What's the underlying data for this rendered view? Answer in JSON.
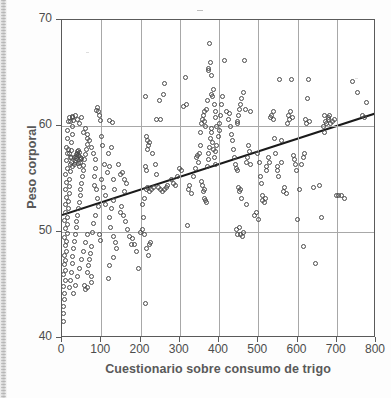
{
  "figure": {
    "kind": "scatter-plot",
    "background_color": "#ffffff",
    "frame_color": "#5a5a5a",
    "grid_color": "#a8a8a8",
    "marker_color": "#4a4a4a",
    "trendline_color": "#1a1a1a",
    "label_color": "#595959"
  },
  "axis": {
    "x_label": "Cuestionario sobre consumo de trigo",
    "y_label": "Peso corporal",
    "x_ticklabels": [
      "0",
      "100",
      "200",
      "300",
      "400",
      "500",
      "600",
      "700",
      "800"
    ],
    "y_ticklabels": [
      "40",
      "50",
      "60",
      "70"
    ]
  },
  "chart_data": {
    "type": "scatter",
    "title": "",
    "xlabel": "Cuestionario sobre consumo de trigo",
    "ylabel": "Peso corporal",
    "xlim": [
      0,
      800
    ],
    "ylim": [
      40,
      70
    ],
    "xticks": [
      0,
      100,
      200,
      300,
      400,
      500,
      600,
      700,
      800
    ],
    "yticks": [
      40,
      50,
      60,
      70
    ],
    "grid": true,
    "legend": null,
    "marker": "open-circle",
    "trendline": {
      "type": "linear-fit",
      "x_start": 0,
      "y_start": 51.6,
      "x_end": 800,
      "y_end": 61.2,
      "slope": 0.012,
      "intercept": 51.6
    },
    "points": [
      [
        3,
        41.6
      ],
      [
        4,
        42.3
      ],
      [
        5,
        43.0
      ],
      [
        6,
        43.6
      ],
      [
        7,
        44.2
      ],
      [
        4,
        44.9
      ],
      [
        8,
        45.4
      ],
      [
        5,
        46.0
      ],
      [
        9,
        46.4
      ],
      [
        6,
        46.9
      ],
      [
        10,
        47.3
      ],
      [
        7,
        47.8
      ],
      [
        11,
        48.2
      ],
      [
        8,
        48.7
      ],
      [
        12,
        49.1
      ],
      [
        6,
        49.5
      ],
      [
        13,
        49.9
      ],
      [
        9,
        50.3
      ],
      [
        14,
        50.7
      ],
      [
        7,
        51.1
      ],
      [
        15,
        51.4
      ],
      [
        10,
        51.8
      ],
      [
        16,
        52.2
      ],
      [
        8,
        52.6
      ],
      [
        17,
        52.9
      ],
      [
        11,
        53.3
      ],
      [
        18,
        53.6
      ],
      [
        9,
        54.0
      ],
      [
        19,
        54.3
      ],
      [
        12,
        54.7
      ],
      [
        20,
        55.0
      ],
      [
        10,
        55.4
      ],
      [
        21,
        55.7
      ],
      [
        13,
        56.0
      ],
      [
        22,
        56.4
      ],
      [
        11,
        56.7
      ],
      [
        23,
        57.0
      ],
      [
        14,
        57.4
      ],
      [
        24,
        57.7
      ],
      [
        12,
        58.0
      ],
      [
        25,
        58.4
      ],
      [
        15,
        58.8
      ],
      [
        26,
        59.2
      ],
      [
        13,
        59.6
      ],
      [
        27,
        60.0
      ],
      [
        17,
        60.4
      ],
      [
        28,
        60.8
      ],
      [
        20,
        44.8
      ],
      [
        22,
        45.4
      ],
      [
        24,
        46.2
      ],
      [
        26,
        47.0
      ],
      [
        28,
        47.7
      ],
      [
        30,
        48.4
      ],
      [
        32,
        49.1
      ],
      [
        34,
        49.8
      ],
      [
        36,
        50.4
      ],
      [
        38,
        51.0
      ],
      [
        40,
        51.6
      ],
      [
        42,
        52.2
      ],
      [
        44,
        52.8
      ],
      [
        46,
        53.4
      ],
      [
        48,
        54.0
      ],
      [
        50,
        54.6
      ],
      [
        52,
        55.2
      ],
      [
        54,
        55.8
      ],
      [
        56,
        56.3
      ],
      [
        58,
        56.8
      ],
      [
        60,
        57.3
      ],
      [
        62,
        57.8
      ],
      [
        64,
        58.3
      ],
      [
        66,
        58.8
      ],
      [
        30,
        44.2
      ],
      [
        35,
        45.0
      ],
      [
        40,
        45.8
      ],
      [
        45,
        46.6
      ],
      [
        50,
        47.4
      ],
      [
        55,
        48.2
      ],
      [
        60,
        49.0
      ],
      [
        65,
        49.8
      ],
      [
        35,
        56.6
      ],
      [
        38,
        56.9
      ],
      [
        41,
        57.2
      ],
      [
        44,
        57.5
      ],
      [
        47,
        56.8
      ],
      [
        33,
        57.0
      ],
      [
        36,
        57.3
      ],
      [
        39,
        57.6
      ],
      [
        42,
        56.5
      ],
      [
        45,
        56.2
      ],
      [
        48,
        57.0
      ],
      [
        31,
        56.4
      ],
      [
        34,
        56.7
      ],
      [
        37,
        57.1
      ],
      [
        40,
        57.4
      ],
      [
        43,
        57.7
      ],
      [
        46,
        56.6
      ],
      [
        49,
        56.9
      ],
      [
        28,
        56.2
      ],
      [
        25,
        56.6
      ],
      [
        22,
        57.0
      ],
      [
        19,
        57.4
      ],
      [
        16,
        57.8
      ],
      [
        30,
        60.5
      ],
      [
        35,
        61.0
      ],
      [
        40,
        60.6
      ],
      [
        45,
        60.2
      ],
      [
        50,
        60.8
      ],
      [
        28,
        60.9
      ],
      [
        22,
        60.4
      ],
      [
        18,
        60.8
      ],
      [
        55,
        59.4
      ],
      [
        60,
        59.8
      ],
      [
        65,
        59.2
      ],
      [
        70,
        58.6
      ],
      [
        75,
        58.0
      ],
      [
        80,
        57.4
      ],
      [
        85,
        56.8
      ],
      [
        88,
        61.5
      ],
      [
        90,
        61.7
      ],
      [
        92,
        61.4
      ],
      [
        95,
        61.0
      ],
      [
        98,
        60.5
      ],
      [
        100,
        59.0
      ],
      [
        102,
        58.2
      ],
      [
        86,
        56.0
      ],
      [
        84,
        55.2
      ],
      [
        82,
        54.4
      ],
      [
        88,
        54.0
      ],
      [
        90,
        53.2
      ],
      [
        92,
        52.4
      ],
      [
        85,
        51.6
      ],
      [
        80,
        50.8
      ],
      [
        78,
        50.0
      ],
      [
        95,
        49.8
      ],
      [
        98,
        49.2
      ],
      [
        75,
        48.6
      ],
      [
        72,
        48.0
      ],
      [
        70,
        47.4
      ],
      [
        68,
        46.8
      ],
      [
        66,
        46.2
      ],
      [
        74,
        45.8
      ],
      [
        76,
        45.2
      ],
      [
        64,
        44.8
      ],
      [
        60,
        44.6
      ],
      [
        58,
        45.0
      ],
      [
        100,
        55.0
      ],
      [
        105,
        54.2
      ],
      [
        110,
        53.4
      ],
      [
        112,
        52.6
      ],
      [
        108,
        56.4
      ],
      [
        115,
        55.6
      ],
      [
        120,
        60.5
      ],
      [
        128,
        60.3
      ],
      [
        125,
        58.0
      ],
      [
        118,
        57.4
      ],
      [
        122,
        56.2
      ],
      [
        130,
        55.0
      ],
      [
        135,
        54.0
      ],
      [
        132,
        53.0
      ],
      [
        126,
        52.2
      ],
      [
        120,
        51.4
      ],
      [
        124,
        50.4
      ],
      [
        130,
        49.6
      ],
      [
        136,
        49.0
      ],
      [
        140,
        48.4
      ],
      [
        132,
        47.6
      ],
      [
        122,
        46.8
      ],
      [
        118,
        45.6
      ],
      [
        145,
        56.4
      ],
      [
        150,
        55.4
      ],
      [
        155,
        55.6
      ],
      [
        160,
        55.0
      ],
      [
        165,
        54.6
      ],
      [
        158,
        53.8
      ],
      [
        152,
        52.4
      ],
      [
        148,
        51.8
      ],
      [
        156,
        51.6
      ],
      [
        162,
        51.0
      ],
      [
        168,
        50.2
      ],
      [
        172,
        49.6
      ],
      [
        176,
        48.8
      ],
      [
        180,
        49.4
      ],
      [
        185,
        48.8
      ],
      [
        190,
        48.2
      ],
      [
        195,
        46.6
      ],
      [
        200,
        50.0
      ],
      [
        205,
        50.2
      ],
      [
        210,
        49.8
      ],
      [
        212,
        43.3
      ],
      [
        215,
        48.4
      ],
      [
        220,
        47.8
      ],
      [
        222,
        48.8
      ],
      [
        225,
        49.0
      ],
      [
        208,
        51.4
      ],
      [
        205,
        52.6
      ],
      [
        210,
        53.2
      ],
      [
        215,
        54.0
      ],
      [
        218,
        54.2
      ],
      [
        222,
        53.8
      ],
      [
        228,
        54.0
      ],
      [
        232,
        54.2
      ],
      [
        215,
        55.8
      ],
      [
        212,
        56.2
      ],
      [
        218,
        57.8
      ],
      [
        220,
        58.2
      ],
      [
        222,
        58.4
      ],
      [
        218,
        58.6
      ],
      [
        215,
        59.0
      ],
      [
        212,
        62.8
      ],
      [
        240,
        60.6
      ],
      [
        248,
        62.4
      ],
      [
        252,
        60.6
      ],
      [
        262,
        64.0
      ],
      [
        258,
        63.0
      ],
      [
        230,
        57.4
      ],
      [
        238,
        56.4
      ],
      [
        242,
        55.4
      ],
      [
        246,
        54.2
      ],
      [
        250,
        54.0
      ],
      [
        255,
        53.8
      ],
      [
        260,
        54.0
      ],
      [
        265,
        54.2
      ],
      [
        270,
        54.4
      ],
      [
        280,
        55.0
      ],
      [
        285,
        54.6
      ],
      [
        290,
        54.4
      ],
      [
        295,
        55.2
      ],
      [
        300,
        56.0
      ],
      [
        305,
        55.8
      ],
      [
        310,
        61.8
      ],
      [
        315,
        64.6
      ],
      [
        318,
        62.0
      ],
      [
        320,
        50.6
      ],
      [
        322,
        54.0
      ],
      [
        325,
        54.4
      ],
      [
        330,
        53.6
      ],
      [
        335,
        55.2
      ],
      [
        340,
        56.0
      ],
      [
        342,
        57.0
      ],
      [
        345,
        57.2
      ],
      [
        348,
        56.6
      ],
      [
        350,
        57.4
      ],
      [
        352,
        58.2
      ],
      [
        354,
        59.4
      ],
      [
        356,
        60.2
      ],
      [
        358,
        60.6
      ],
      [
        360,
        61.0
      ],
      [
        362,
        61.4
      ],
      [
        364,
        60.4
      ],
      [
        366,
        60.0
      ],
      [
        368,
        61.6
      ],
      [
        370,
        62.4
      ],
      [
        372,
        65.2
      ],
      [
        374,
        65.4
      ],
      [
        376,
        67.8
      ],
      [
        378,
        66.0
      ],
      [
        380,
        64.8
      ],
      [
        382,
        63.0
      ],
      [
        384,
        62.8
      ],
      [
        386,
        63.4
      ],
      [
        388,
        62.0
      ],
      [
        390,
        61.4
      ],
      [
        392,
        60.8
      ],
      [
        394,
        60.0
      ],
      [
        355,
        54.8
      ],
      [
        358,
        54.4
      ],
      [
        360,
        53.8
      ],
      [
        362,
        53.2
      ],
      [
        364,
        54.0
      ],
      [
        366,
        53.0
      ],
      [
        368,
        52.8
      ],
      [
        370,
        56.2
      ],
      [
        372,
        56.8
      ],
      [
        374,
        57.4
      ],
      [
        376,
        58.0
      ],
      [
        378,
        58.8
      ],
      [
        380,
        59.4
      ],
      [
        382,
        59.8
      ],
      [
        384,
        58.4
      ],
      [
        386,
        57.8
      ],
      [
        388,
        57.0
      ],
      [
        390,
        56.4
      ],
      [
        392,
        57.6
      ],
      [
        394,
        58.2
      ],
      [
        398,
        59.0
      ],
      [
        400,
        59.6
      ],
      [
        402,
        60.2
      ],
      [
        404,
        61.0
      ],
      [
        406,
        62.0
      ],
      [
        410,
        62.8
      ],
      [
        415,
        66.2
      ],
      [
        420,
        61.4
      ],
      [
        425,
        60.6
      ],
      [
        428,
        61.2
      ],
      [
        430,
        60.0
      ],
      [
        432,
        59.2
      ],
      [
        435,
        58.6
      ],
      [
        438,
        57.8
      ],
      [
        440,
        57.0
      ],
      [
        442,
        56.4
      ],
      [
        445,
        56.0
      ],
      [
        448,
        55.8
      ],
      [
        450,
        54.2
      ],
      [
        452,
        53.8
      ],
      [
        455,
        54.0
      ],
      [
        444,
        50.2
      ],
      [
        448,
        49.8
      ],
      [
        452,
        50.4
      ],
      [
        456,
        49.8
      ],
      [
        460,
        49.6
      ],
      [
        462,
        50.0
      ],
      [
        458,
        53.2
      ],
      [
        462,
        63.2
      ],
      [
        458,
        62.6
      ],
      [
        455,
        62.0
      ],
      [
        452,
        61.6
      ],
      [
        450,
        61.0
      ],
      [
        448,
        60.2
      ],
      [
        446,
        60.4
      ],
      [
        465,
        66.2
      ],
      [
        468,
        61.6
      ],
      [
        470,
        56.6
      ],
      [
        472,
        57.0
      ],
      [
        475,
        58.2
      ],
      [
        478,
        57.6
      ],
      [
        480,
        56.4
      ],
      [
        470,
        52.6
      ],
      [
        480,
        61.4
      ],
      [
        490,
        51.6
      ],
      [
        495,
        51.8
      ],
      [
        500,
        51.2
      ],
      [
        498,
        57.4
      ],
      [
        502,
        56.6
      ],
      [
        505,
        55.2
      ],
      [
        508,
        54.6
      ],
      [
        510,
        53.4
      ],
      [
        512,
        53.0
      ],
      [
        515,
        52.8
      ],
      [
        518,
        53.2
      ],
      [
        520,
        55.8
      ],
      [
        522,
        56.2
      ],
      [
        525,
        57.0
      ],
      [
        528,
        56.6
      ],
      [
        530,
        60.8
      ],
      [
        535,
        61.0
      ],
      [
        538,
        61.4
      ],
      [
        540,
        60.6
      ],
      [
        542,
        58.8
      ],
      [
        545,
        57.4
      ],
      [
        548,
        56.2
      ],
      [
        550,
        55.8
      ],
      [
        552,
        55.2
      ],
      [
        555,
        64.4
      ],
      [
        558,
        58.6
      ],
      [
        560,
        56.6
      ],
      [
        565,
        53.8
      ],
      [
        568,
        54.2
      ],
      [
        572,
        53.6
      ],
      [
        575,
        60.2
      ],
      [
        578,
        61.0
      ],
      [
        580,
        60.6
      ],
      [
        582,
        61.4
      ],
      [
        585,
        64.4
      ],
      [
        588,
        60.8
      ],
      [
        590,
        57.2
      ],
      [
        592,
        56.8
      ],
      [
        595,
        56.4
      ],
      [
        598,
        55.8
      ],
      [
        600,
        51.2
      ],
      [
        605,
        54.0
      ],
      [
        610,
        56.4
      ],
      [
        615,
        57.0
      ],
      [
        618,
        57.4
      ],
      [
        620,
        60.6
      ],
      [
        622,
        60.2
      ],
      [
        625,
        62.6
      ],
      [
        628,
        64.4
      ],
      [
        630,
        60.4
      ],
      [
        615,
        48.6
      ],
      [
        645,
        47.0
      ],
      [
        640,
        54.2
      ],
      [
        655,
        54.4
      ],
      [
        660,
        51.4
      ],
      [
        665,
        60.0
      ],
      [
        668,
        59.4
      ],
      [
        670,
        61.0
      ],
      [
        672,
        60.4
      ],
      [
        675,
        60.2
      ],
      [
        678,
        60.6
      ],
      [
        680,
        60.8
      ],
      [
        682,
        61.0
      ],
      [
        685,
        60.2
      ],
      [
        690,
        60.4
      ],
      [
        695,
        60.6
      ],
      [
        700,
        53.4
      ],
      [
        705,
        53.4
      ],
      [
        712,
        53.4
      ],
      [
        720,
        53.2
      ],
      [
        740,
        64.2
      ],
      [
        752,
        63.2
      ],
      [
        775,
        62.2
      ],
      [
        770,
        60.8
      ],
      [
        765,
        61.0
      ]
    ]
  }
}
